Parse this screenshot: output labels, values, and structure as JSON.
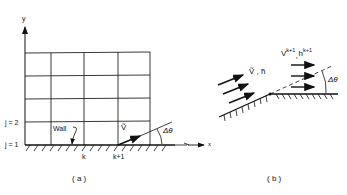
{
  "figure_a": {
    "caption": "( a )",
    "axis_y": "y",
    "axis_x": "x",
    "row_labels": [
      "j = 2",
      "j = 1"
    ],
    "column_labels": [
      "k",
      "k+1"
    ],
    "wall_label": "Wall",
    "velocity_label": "Ṽ",
    "angle_label": "Δθ"
  },
  "figure_b": {
    "caption": "( b )",
    "upstream_label": "Ṽ , h̃",
    "downstream_label_base_v": "V",
    "downstream_label_sup_v": "k+1",
    "downstream_label_sep": ",",
    "downstream_label_base_h": "h",
    "downstream_label_sup_h": "k+1",
    "angle_label": "Δθ"
  },
  "colors": {
    "ink": "#111111",
    "background": "#ffffff"
  }
}
